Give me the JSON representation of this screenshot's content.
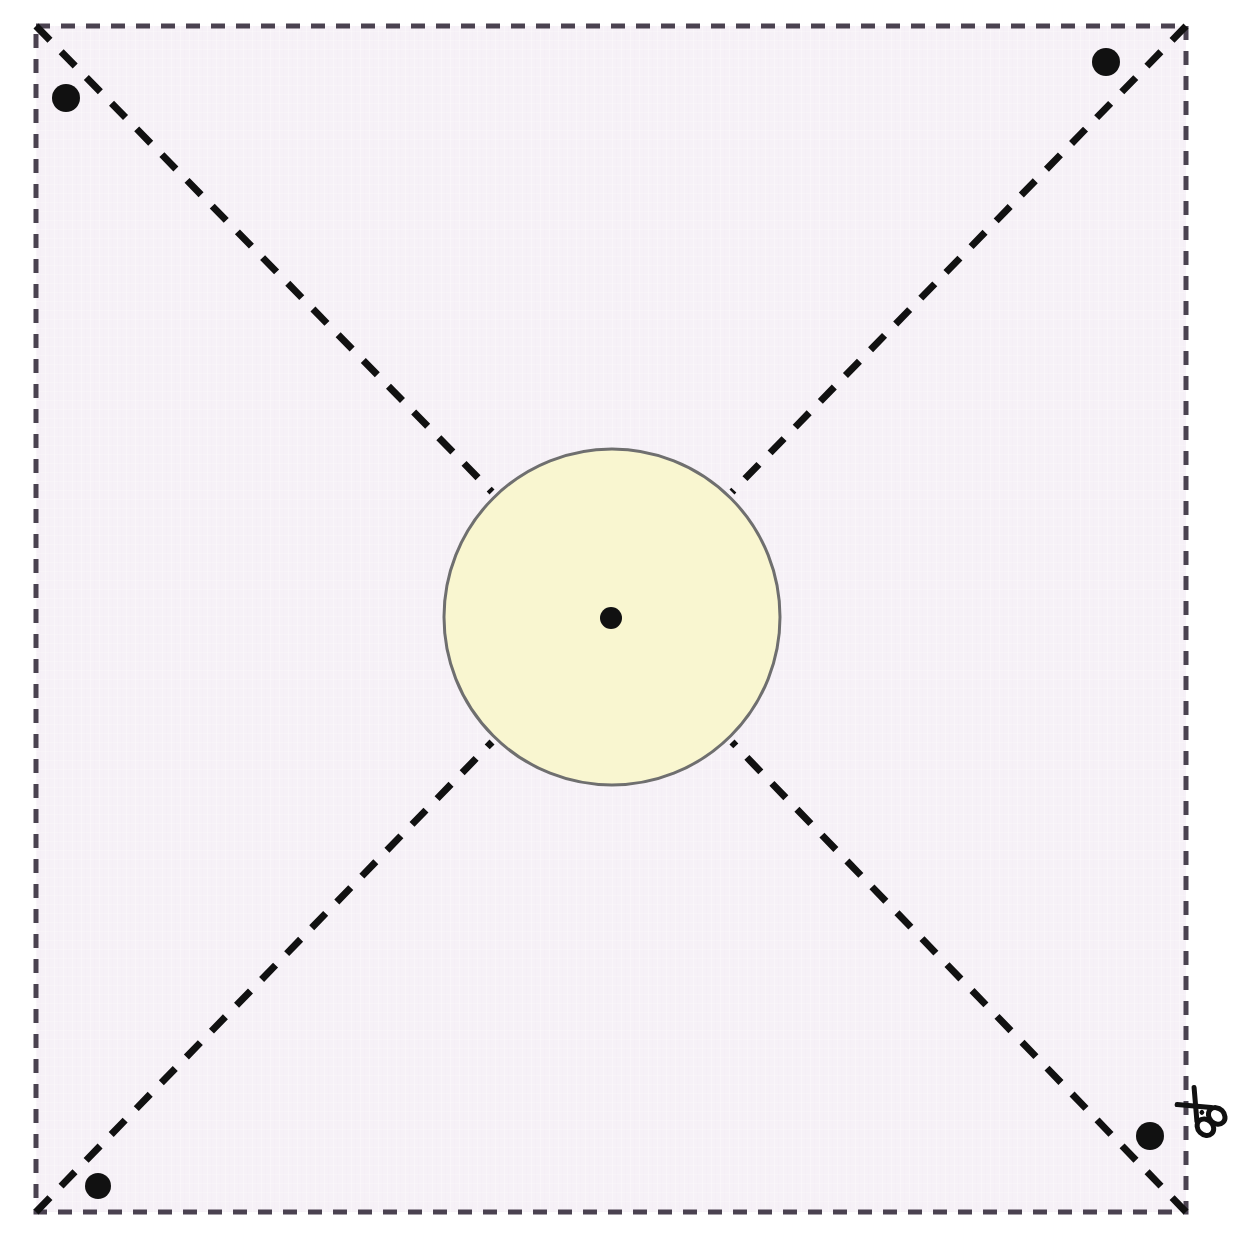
{
  "document": {
    "title": "Square Cutting Template with Central Circle",
    "type": "craft-cut-pattern",
    "width": 1233,
    "height": 1248
  },
  "colors": {
    "page_background": "#ffffff",
    "panel_background": "#f6f1f7",
    "cut_line": "#4a4250",
    "fold_line": "#111111",
    "circle_fill": "#f9f6d0",
    "circle_stroke": "#6f6f6f",
    "marker_dot": "#111111",
    "scissors": "#111111"
  },
  "panel": {
    "name": "fabric-panel",
    "x": 36,
    "y": 26,
    "width": 1150,
    "height": 1186,
    "fill": "#f6f1f7"
  },
  "cut_border": {
    "name": "cut-line-border",
    "style": "dashed",
    "dash_length": 14,
    "gap_length": 11,
    "stroke_width": 5,
    "color": "#4a4250"
  },
  "fold_lines": {
    "name": "diagonal-fold-lines",
    "style": "dashed",
    "dash_length": 20,
    "gap_length": 16,
    "stroke_width": 7,
    "color": "#111111",
    "count": 4,
    "segments": [
      {
        "label": "top-left-diagonal",
        "x1": 36,
        "y1": 26,
        "x2": 492,
        "y2": 492
      },
      {
        "label": "top-right-diagonal",
        "x1": 1186,
        "y1": 26,
        "x2": 732,
        "y2": 492
      },
      {
        "label": "bottom-left-diagonal",
        "x1": 36,
        "y1": 1212,
        "x2": 492,
        "y2": 742
      },
      {
        "label": "bottom-right-diagonal",
        "x1": 1186,
        "y1": 1212,
        "x2": 732,
        "y2": 742
      }
    ]
  },
  "center_circle": {
    "name": "center-circle",
    "cx": 612,
    "cy": 617,
    "r": 168,
    "fill": "#f9f6d0",
    "stroke": "#6f6f6f",
    "stroke_width": 3
  },
  "center_dot": {
    "name": "center-point-marker",
    "cx": 611,
    "cy": 618,
    "r": 11,
    "fill": "#111111"
  },
  "corner_markers": [
    {
      "label": "top-left-marker",
      "cx": 66,
      "cy": 98,
      "r": 14
    },
    {
      "label": "top-right-marker",
      "cx": 1106,
      "cy": 62,
      "r": 14
    },
    {
      "label": "bottom-left-marker",
      "cx": 98,
      "cy": 1186,
      "r": 13
    },
    {
      "label": "bottom-right-marker",
      "cx": 1150,
      "cy": 1136,
      "r": 14
    }
  ],
  "scissors_icon": {
    "name": "scissors-icon",
    "x": 1182,
    "y": 1082,
    "width": 44,
    "height": 48,
    "rotation": -45,
    "meaning": "cut-here"
  }
}
